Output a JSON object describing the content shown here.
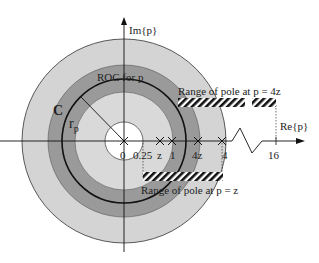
{
  "diagram": {
    "type": "complex-plane ROC diagram",
    "axes": {
      "imag_label": "Im{p}",
      "real_label": "Re{p}"
    },
    "axis_ticks": [
      {
        "label": "0",
        "value": 0
      },
      {
        "label": "0.25",
        "value": 0.25
      },
      {
        "label": "z",
        "value": "z"
      },
      {
        "label": "1",
        "value": 1
      },
      {
        "label": "4z",
        "value": "4z"
      },
      {
        "label": "4",
        "value": 4
      },
      {
        "label": "16",
        "value": 16
      }
    ],
    "labels": {
      "roc": "ROC for p",
      "contour": "C",
      "radius": "r",
      "radius_sub": "p",
      "range_4z": "Range of  pole at p = 4z",
      "range_z": "Range of  pole at p = z"
    },
    "colors": {
      "outer_ring": "#d4d4d4",
      "roc_ring": "#9a9a9a",
      "inner_disk": "#d9d9d9",
      "hole": "#ffffff",
      "lines": "#111111"
    }
  }
}
